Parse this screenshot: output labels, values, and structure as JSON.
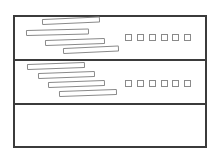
{
  "canvas": {
    "width": 216,
    "height": 160,
    "background": "#ffffff"
  },
  "colors": {
    "frame_border": "#3b3b3b",
    "divider": "#3b3b3b",
    "shape_border": "#8a8a8a",
    "shape_fill": "#ffffff"
  },
  "frame": {
    "x": 13,
    "y": 15,
    "width": 194,
    "height": 133
  },
  "dividers": [
    {
      "x": 13,
      "y": 59,
      "width": 194
    },
    {
      "x": 13,
      "y": 103,
      "width": 194
    }
  ],
  "rows": [
    {
      "name": "list-row-1",
      "region": {
        "x": 13,
        "y": 15,
        "width": 194,
        "height": 45
      },
      "bars": [
        {
          "x": 42,
          "y": 19,
          "w": 58,
          "h": 6,
          "tilt": -2.5
        },
        {
          "x": 26,
          "y": 30,
          "w": 63,
          "h": 6,
          "tilt": -1.5
        },
        {
          "x": 45,
          "y": 40,
          "w": 60,
          "h": 6,
          "tilt": -2.0
        },
        {
          "x": 63,
          "y": 48,
          "w": 56,
          "h": 6,
          "tilt": -2.5
        }
      ],
      "squares": {
        "y": 34,
        "size": 7,
        "xs": [
          125,
          137,
          149,
          161,
          172,
          184
        ]
      }
    },
    {
      "name": "list-row-2",
      "region": {
        "x": 13,
        "y": 60,
        "width": 194,
        "height": 44
      },
      "bars": [
        {
          "x": 27,
          "y": 64,
          "w": 58,
          "h": 6,
          "tilt": -2.0
        },
        {
          "x": 38,
          "y": 73,
          "w": 57,
          "h": 6,
          "tilt": -2.0
        },
        {
          "x": 48,
          "y": 82,
          "w": 57,
          "h": 6,
          "tilt": -2.0
        },
        {
          "x": 59,
          "y": 91,
          "w": 58,
          "h": 6,
          "tilt": -2.0
        }
      ],
      "squares": {
        "y": 80,
        "size": 7,
        "xs": [
          125,
          137,
          149,
          161,
          172,
          184
        ]
      }
    },
    {
      "name": "list-row-3",
      "region": {
        "x": 13,
        "y": 104,
        "width": 194,
        "height": 44
      },
      "bars": [],
      "squares": null
    }
  ]
}
